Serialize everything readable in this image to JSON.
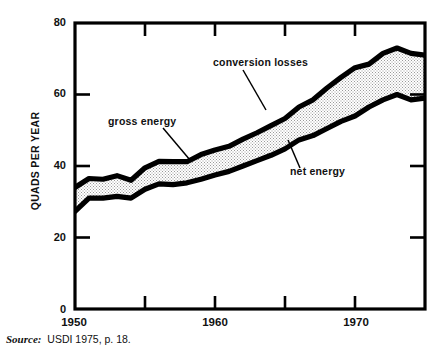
{
  "figure": {
    "source_note": {
      "label": "Source:",
      "text": "USDI 1975, p. 18."
    }
  },
  "chart_data": {
    "type": "area",
    "title": "",
    "subtitle": "",
    "xlabel": "",
    "ylabel": "QUADS PER YEAR",
    "xlim": [
      1950,
      1975
    ],
    "ylim": [
      0,
      80
    ],
    "grid": false,
    "legend_position": "inline-annotations",
    "yticks": [
      0,
      20,
      40,
      60,
      80
    ],
    "ytick_labels": [
      "0",
      "20",
      "40",
      "60",
      "80"
    ],
    "xticks": [
      1950,
      1955,
      1960,
      1965,
      1970,
      1975
    ],
    "xtick_labels": [
      "1950",
      "",
      "1960",
      "",
      "1970",
      ""
    ],
    "xtick_labels_shown": [
      "1950",
      "1960",
      "1970"
    ],
    "x": [
      1950,
      1951,
      1952,
      1953,
      1954,
      1955,
      1956,
      1957,
      1958,
      1959,
      1960,
      1961,
      1962,
      1963,
      1964,
      1965,
      1966,
      1967,
      1968,
      1969,
      1970,
      1971,
      1972,
      1973,
      1974,
      1975
    ],
    "series": [
      {
        "name": "gross energy",
        "values": [
          34.0,
          36.5,
          36.3,
          37.3,
          36.0,
          39.5,
          41.3,
          41.2,
          41.2,
          43.2,
          44.5,
          45.5,
          47.5,
          49.3,
          51.3,
          53.3,
          56.5,
          58.5,
          61.8,
          64.8,
          67.5,
          68.5,
          71.5,
          73.0,
          71.5,
          71.0
        ],
        "annotation": "gross energy"
      },
      {
        "name": "net energy",
        "values": [
          27.3,
          31.0,
          31.0,
          31.5,
          31.0,
          33.5,
          35.0,
          34.8,
          35.3,
          36.3,
          37.5,
          38.5,
          40.0,
          41.5,
          43.0,
          44.8,
          47.3,
          48.5,
          50.5,
          52.5,
          54.0,
          56.5,
          58.5,
          60.0,
          58.5,
          59.0
        ],
        "annotation": "net energy"
      }
    ],
    "band_annotation": "conversion losses",
    "annotations": [
      {
        "text": "conversion losses",
        "id": "conversion-losses"
      },
      {
        "text": "gross energy",
        "id": "gross-energy"
      },
      {
        "text": "net energy",
        "id": "net-energy"
      }
    ]
  }
}
